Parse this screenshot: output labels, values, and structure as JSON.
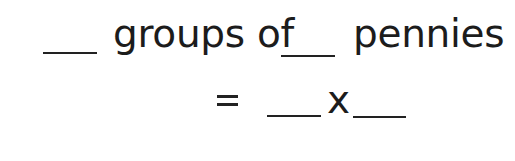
{
  "worksheet": {
    "line1": {
      "blank_groups": "",
      "text_groups_of": "groups of",
      "blank_per_group": "",
      "text_pennies": "pennies"
    },
    "line2": {
      "equals": "=",
      "blank_factor_1": "",
      "times": "x",
      "blank_factor_2": ""
    }
  },
  "colors": {
    "ink": "#1c1c1c",
    "background": "#ffffff"
  }
}
